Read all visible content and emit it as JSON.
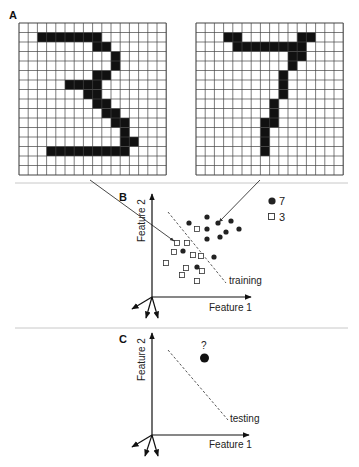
{
  "panels": {
    "a": {
      "label": "A",
      "grid_size": 16,
      "digits": [
        {
          "name": "3",
          "origin": [
            19,
            23
          ],
          "cell_w": 9.2,
          "cell_h": 9.5,
          "filled_rows": {
            "1": [
              [
                2,
                8
              ]
            ],
            "2": [
              [
                8,
                9
              ]
            ],
            "3": [
              [
                10,
                10
              ]
            ],
            "4": [
              [
                10,
                10
              ]
            ],
            "5": [
              [
                8,
                9
              ]
            ],
            "6": [
              [
                5,
                8
              ]
            ],
            "7": [
              [
                7,
                8
              ]
            ],
            "8": [
              [
                8,
                9
              ]
            ],
            "9": [
              [
                9,
                10
              ]
            ],
            "10": [
              [
                10,
                11
              ]
            ],
            "11": [
              [
                11,
                11
              ]
            ],
            "12": [
              [
                11,
                12
              ]
            ],
            "13": [
              [
                3,
                11
              ]
            ]
          }
        },
        {
          "name": "7",
          "origin": [
            196,
            23
          ],
          "cell_w": 9.2,
          "cell_h": 9.5,
          "filled_rows": {
            "1": [
              [
                3,
                4
              ],
              [
                11,
                12
              ]
            ],
            "2": [
              [
                4,
                11
              ]
            ],
            "3": [
              [
                10,
                11
              ]
            ],
            "4": [
              [
                10,
                10
              ]
            ],
            "5": [
              [
                9,
                9
              ]
            ],
            "6": [
              [
                9,
                9
              ]
            ],
            "7": [
              [
                9,
                9
              ]
            ],
            "8": [
              [
                8,
                8
              ]
            ],
            "9": [
              [
                8,
                8
              ]
            ],
            "10": [
              [
                7,
                8
              ]
            ],
            "11": [
              [
                7,
                7
              ]
            ],
            "12": [
              [
                7,
                7
              ]
            ],
            "13": [
              [
                7,
                7
              ]
            ]
          }
        }
      ]
    },
    "b": {
      "label": "B",
      "x_axis_label": "Feature 1",
      "y_axis_label": "Feature 2",
      "boundary_label": "training",
      "legend": [
        {
          "marker": "filled-circle",
          "label": "7"
        },
        {
          "marker": "open-square",
          "label": "3"
        }
      ],
      "points_7": [
        [
          189,
          223
        ],
        [
          207,
          217
        ],
        [
          218,
          223
        ],
        [
          231,
          221
        ],
        [
          207,
          229
        ],
        [
          226,
          232
        ],
        [
          239,
          229
        ],
        [
          207,
          239
        ],
        [
          220,
          237
        ],
        [
          183,
          251
        ],
        [
          214,
          257
        ],
        [
          197,
          267
        ]
      ],
      "points_3": [
        [
          197,
          229
        ],
        [
          177,
          243
        ],
        [
          187,
          243
        ],
        [
          174,
          252
        ],
        [
          193,
          255
        ],
        [
          201,
          256
        ],
        [
          166,
          263
        ],
        [
          186,
          268
        ],
        [
          202,
          271
        ],
        [
          182,
          275
        ],
        [
          197,
          281
        ]
      ]
    },
    "c": {
      "label": "C",
      "x_axis_label": "Feature 1",
      "y_axis_label": "Feature 2",
      "boundary_label": "testing",
      "unknown_label": "?"
    }
  },
  "colors": {
    "ink": "#111111",
    "grid_line": "#444444",
    "separator": "#c8c8c8",
    "dashed": "#555555"
  }
}
